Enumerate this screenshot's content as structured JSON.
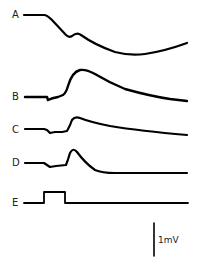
{
  "figure": {
    "traces": [
      {
        "label": "A",
        "description": "Slow negative deflection with small notch, then slow recovery"
      },
      {
        "label": "B",
        "description": "Small dip followed by large positive wave with slow decay"
      },
      {
        "label": "C",
        "description": "Small dip followed by moderate positive wave with slow decay"
      },
      {
        "label": "D",
        "description": "Small dip followed by sharp positive peak with fast decay"
      },
      {
        "label": "E",
        "description": "Rectangular stimulus pulse marker"
      }
    ],
    "scale_bar": {
      "label": "1mV"
    }
  }
}
